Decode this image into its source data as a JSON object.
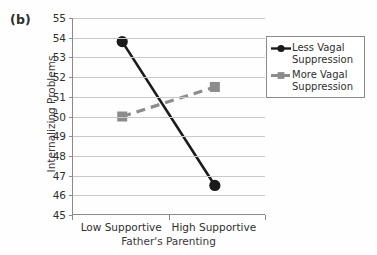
{
  "panel": {
    "label": "(b)"
  },
  "chart_data": {
    "type": "line",
    "title": "",
    "subtitle": "",
    "xlabel": "Father's Parenting",
    "ylabel": "Internalizing Problems",
    "categories": [
      "Low Supportive",
      "High Supportive"
    ],
    "ylim": [
      45,
      55
    ],
    "yticks": [
      55,
      54,
      53,
      52,
      51,
      50,
      49,
      48,
      47,
      46,
      45
    ],
    "grid": true,
    "legend_position": "right",
    "series": [
      {
        "name": "Less Vagal Suppression",
        "values": [
          53.8,
          46.5
        ],
        "color": "#1a1a1a",
        "marker": "circle",
        "linestyle": "solid"
      },
      {
        "name": "More Vagal Suppression",
        "values": [
          50.0,
          51.5
        ],
        "color": "#8c8c8c",
        "marker": "square",
        "linestyle": "dashed"
      }
    ]
  },
  "legend": {
    "entries": [
      {
        "label": "Less Vagal\nSuppression",
        "color": "#1a1a1a",
        "marker": "circle-marker-icon"
      },
      {
        "label": "More Vagal\nSuppression",
        "color": "#8c8c8c",
        "marker": "square-marker-icon"
      }
    ]
  },
  "colors": {
    "axis": "#8a8a8a",
    "grid": "#c9c9c9",
    "series_dark": "#1a1a1a",
    "series_gray": "#8c8c8c",
    "background": "#fefefe"
  }
}
